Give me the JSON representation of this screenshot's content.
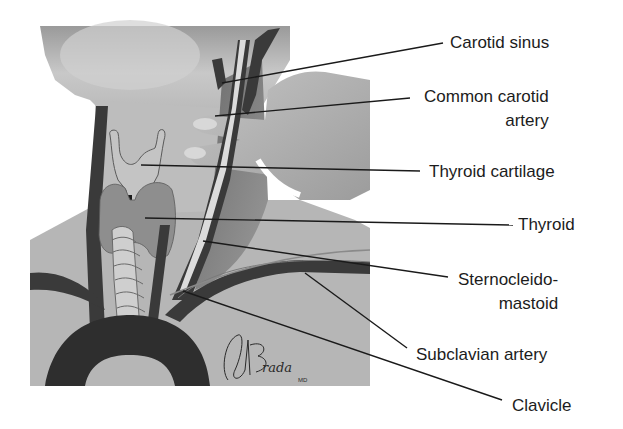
{
  "figure": {
    "type": "anatomical illustration"
  },
  "labels": [
    {
      "id": "carotid-sinus",
      "lines": [
        "Carotid sinus"
      ]
    },
    {
      "id": "common-carotid-artery",
      "lines": [
        "Common carotid",
        "artery"
      ]
    },
    {
      "id": "thyroid-cartilage",
      "lines": [
        "Thyroid cartilage"
      ]
    },
    {
      "id": "thyroid",
      "lines": [
        "Thyroid"
      ]
    },
    {
      "id": "sternocleidomastoid",
      "lines": [
        "Sternocleido-",
        "mastoid"
      ]
    },
    {
      "id": "subclavian-artery",
      "lines": [
        "Subclavian artery"
      ]
    },
    {
      "id": "clavicle",
      "lines": [
        "Clavicle"
      ]
    }
  ],
  "signature": {
    "name": "ABrada",
    "suffix": "MD"
  },
  "colors": {
    "skin": "#b4b4b4",
    "skin_light": "#cfcfcf",
    "artery": "#3a3a3a",
    "thyroid": "#8e8e8e",
    "muscle": "#7a7a7a",
    "leader_line": "#1a1a1a",
    "text": "#1c1c1c",
    "background": "#ffffff"
  }
}
